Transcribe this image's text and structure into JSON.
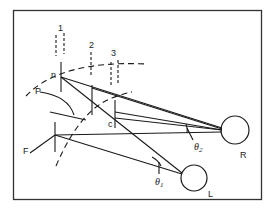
{
  "diagram": {
    "type": "stereo-vision geometry",
    "labels": {
      "rod1": "1",
      "rod2": "2",
      "rod3": "3",
      "near_point": "n",
      "P": "P",
      "F": "F",
      "c": "c",
      "theta1": "θ",
      "theta1_sub": "1",
      "theta2": "θ",
      "theta2_sub": "2",
      "right_eye": "R",
      "left_eye": "L"
    },
    "colors": {
      "line": "#1a1a1a",
      "background": "#ffffff",
      "frame": "#333333"
    }
  }
}
